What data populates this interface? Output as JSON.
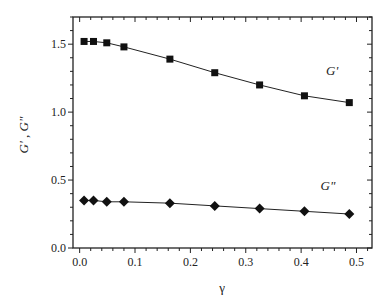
{
  "chart_data": {
    "type": "line",
    "title": "",
    "xlabel": "γ",
    "ylabel": "G' , G\"",
    "xlim": [
      -0.012,
      0.528
    ],
    "ylim": [
      0.0,
      1.7
    ],
    "xticks": [
      0.0,
      0.1,
      0.2,
      0.3,
      0.4,
      0.5
    ],
    "xtick_labels": [
      "0.0",
      "0.1",
      "0.2",
      "0.3",
      "0.4",
      "0.5"
    ],
    "yticks": [
      0.0,
      0.5,
      1.0,
      1.5
    ],
    "ytick_labels": [
      "0.0",
      "0.5",
      "1.0",
      "1.5"
    ],
    "grid": false,
    "legend": "inline labels",
    "series": [
      {
        "name": "G'",
        "marker": "square",
        "color": "#111111",
        "x": [
          0.008,
          0.025,
          0.049,
          0.08,
          0.163,
          0.244,
          0.325,
          0.406,
          0.487
        ],
        "values": [
          1.52,
          1.52,
          1.51,
          1.48,
          1.39,
          1.29,
          1.2,
          1.12,
          1.07
        ],
        "label_pos": [
          0.445,
          1.27
        ]
      },
      {
        "name": "G\"",
        "marker": "diamond",
        "color": "#111111",
        "x": [
          0.008,
          0.025,
          0.049,
          0.08,
          0.163,
          0.244,
          0.325,
          0.406,
          0.487
        ],
        "values": [
          0.35,
          0.35,
          0.34,
          0.34,
          0.33,
          0.31,
          0.29,
          0.27,
          0.25
        ],
        "label_pos": [
          0.435,
          0.43
        ]
      }
    ]
  },
  "labels": {
    "xlabel": "γ",
    "ylabel": "G' , G\"",
    "series_gp": "G'",
    "series_gpp": "G\""
  }
}
